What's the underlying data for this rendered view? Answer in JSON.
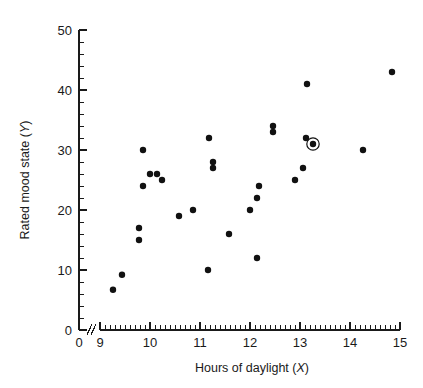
{
  "chart_data": {
    "type": "scatter",
    "title": "",
    "xlabel": "Hours of daylight (X)",
    "ylabel": "Rated mood state (Y)",
    "xlabel_text": "Hours of daylight (",
    "xlabel_var": "X",
    "xlabel_close": ")",
    "ylabel_text": "Rated mood state (",
    "ylabel_var": "Y",
    "ylabel_close": ")",
    "xlim": [
      9,
      15
    ],
    "ylim": [
      0,
      50
    ],
    "x_major_ticks": [
      9,
      10,
      11,
      12,
      13,
      14,
      15
    ],
    "x_tick_labels": [
      "9",
      "10",
      "11",
      "12",
      "13",
      "14",
      "15"
    ],
    "x_origin_label": "0",
    "x_minor_step": 0.1,
    "y_major_ticks": [
      0,
      10,
      20,
      30,
      40,
      50
    ],
    "y_tick_labels": [
      "0",
      "10",
      "20",
      "30",
      "40",
      "50"
    ],
    "y_minor_step": 2,
    "axis_break": true,
    "axis_break_symbol": "//",
    "grid": false,
    "legend": null,
    "marker_color": "#111111",
    "axis_color": "#1a1a1a",
    "background_color": "#ffffff",
    "points": [
      {
        "x": 9.26,
        "y": 6.7,
        "highlighted": false
      },
      {
        "x": 9.44,
        "y": 9.2,
        "highlighted": false
      },
      {
        "x": 9.78,
        "y": 17.0,
        "highlighted": false
      },
      {
        "x": 9.78,
        "y": 15.0,
        "highlighted": false
      },
      {
        "x": 9.86,
        "y": 30.0,
        "highlighted": false
      },
      {
        "x": 9.86,
        "y": 24.0,
        "highlighted": false
      },
      {
        "x": 10.0,
        "y": 26.0,
        "highlighted": false
      },
      {
        "x": 10.14,
        "y": 26.0,
        "highlighted": false
      },
      {
        "x": 10.24,
        "y": 25.0,
        "highlighted": false
      },
      {
        "x": 10.58,
        "y": 19.0,
        "highlighted": false
      },
      {
        "x": 10.86,
        "y": 20.0,
        "highlighted": false
      },
      {
        "x": 11.18,
        "y": 32.0,
        "highlighted": false
      },
      {
        "x": 11.26,
        "y": 28.0,
        "highlighted": false
      },
      {
        "x": 11.26,
        "y": 27.0,
        "highlighted": false
      },
      {
        "x": 11.16,
        "y": 10.0,
        "highlighted": false
      },
      {
        "x": 11.58,
        "y": 16.0,
        "highlighted": false
      },
      {
        "x": 12.0,
        "y": 20.0,
        "highlighted": false
      },
      {
        "x": 12.14,
        "y": 22.0,
        "highlighted": false
      },
      {
        "x": 12.18,
        "y": 24.0,
        "highlighted": false
      },
      {
        "x": 12.14,
        "y": 12.0,
        "highlighted": false
      },
      {
        "x": 12.46,
        "y": 34.0,
        "highlighted": false
      },
      {
        "x": 12.46,
        "y": 33.0,
        "highlighted": false
      },
      {
        "x": 12.9,
        "y": 25.0,
        "highlighted": false
      },
      {
        "x": 13.06,
        "y": 27.0,
        "highlighted": false
      },
      {
        "x": 13.14,
        "y": 41.0,
        "highlighted": false
      },
      {
        "x": 13.12,
        "y": 32.0,
        "highlighted": false
      },
      {
        "x": 13.26,
        "y": 31.0,
        "highlighted": true
      },
      {
        "x": 14.26,
        "y": 30.0,
        "highlighted": false
      },
      {
        "x": 14.84,
        "y": 43.0,
        "highlighted": false
      }
    ]
  }
}
